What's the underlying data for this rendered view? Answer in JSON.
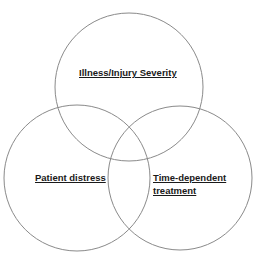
{
  "diagram": {
    "type": "venn",
    "stroke_color": "#8a8a8a",
    "circles": [
      {
        "id": "top",
        "label": "Illness/Injury Severity",
        "cx": 129,
        "cy": 87,
        "r": 74
      },
      {
        "id": "bottom-left",
        "label": "Patient distress",
        "cx": 77,
        "cy": 178,
        "r": 73
      },
      {
        "id": "bottom-right",
        "label_line1": "Time-dependent",
        "label_line2": "treatment",
        "cx": 180,
        "cy": 178,
        "r": 72
      }
    ]
  }
}
